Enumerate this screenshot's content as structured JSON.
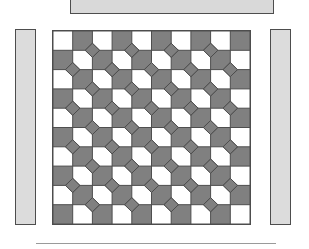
{
  "figure": {
    "background_color": "#ffffff"
  },
  "top_bar": {
    "name": "top-horizontal-bar",
    "fill_color": "#d9d9d9",
    "stroke_color": "#4d4d4d",
    "x": 70,
    "y": -10,
    "width": 204,
    "height": 24
  },
  "side_bars": [
    {
      "name": "left-vertical-bar",
      "position": "left",
      "fill_color": "#dcdcdc",
      "stroke_color": "#4d4d4d",
      "x": 15,
      "y": 29,
      "width": 21,
      "height": 196
    },
    {
      "name": "right-vertical-bar",
      "position": "right",
      "fill_color": "#dcdcdc",
      "stroke_color": "#4d4d4d",
      "x": 270,
      "y": 29,
      "width": 21,
      "height": 196
    }
  ],
  "bottom_rule": {
    "name": "bottom-horizontal-rule",
    "color": "#9a9a9a",
    "x": 36,
    "y": 243,
    "width": 240,
    "height": 1
  },
  "pattern": {
    "name": "checkerboard-diamond-tiling",
    "x": 52,
    "y": 30,
    "width": 199,
    "height": 195,
    "columns": 10,
    "rows": 10,
    "cell_size": 19.7,
    "gray_color": "#808080",
    "white_color": "#ffffff",
    "stroke_color": "#4d4d4d",
    "stroke_width": 1,
    "diamond_color": "#808080",
    "diamond_half_diagonal": 7.2,
    "diamond_origin_offset": 1,
    "description": "Checkerboard of gray and white squares with gray diamonds centered on every other interior lattice vertex"
  }
}
